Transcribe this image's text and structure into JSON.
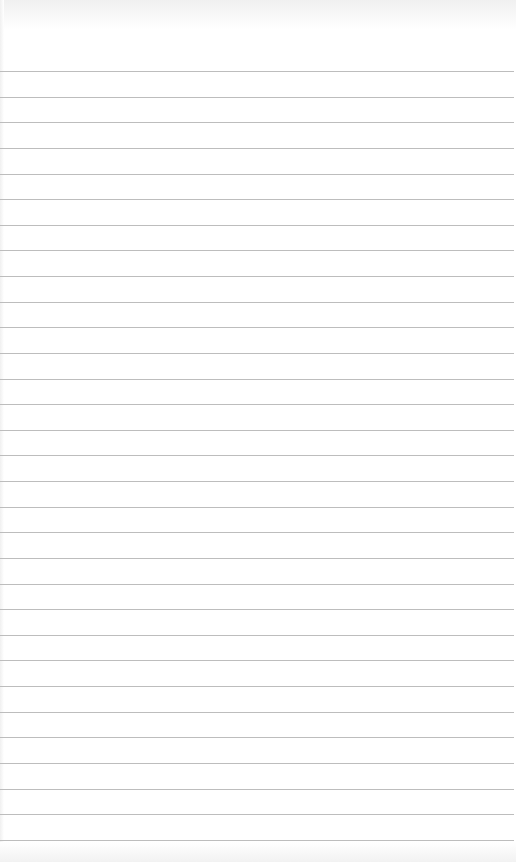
{
  "page": {
    "type": "lined-paper",
    "background_color": "#ffffff",
    "line_color": "#bdbdbd",
    "line_count": 31,
    "first_line_y": 71,
    "line_spacing": 25.63
  }
}
